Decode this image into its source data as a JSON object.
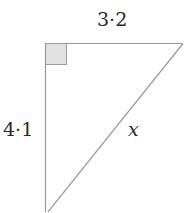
{
  "diagram": {
    "type": "right-triangle",
    "labels": {
      "top_side": "3·2",
      "left_side": "4·1",
      "hypotenuse": "x"
    },
    "colors": {
      "line": "#9a9a9a",
      "right_angle_fill": "#e2e2e2",
      "text": "#2a2a2a"
    }
  }
}
